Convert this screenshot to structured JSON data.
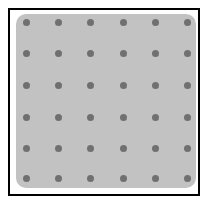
{
  "game": {
    "type": "dot-grid-board",
    "rows": 6,
    "cols": 6,
    "colors": {
      "frame": "#000000",
      "board": "#c2c2c2",
      "dot": "#707070",
      "background": "#ffffff"
    },
    "dot_x": [
      26,
      58,
      90,
      123,
      155,
      187
    ],
    "dot_y": [
      22,
      53,
      85,
      117,
      148,
      178
    ]
  }
}
